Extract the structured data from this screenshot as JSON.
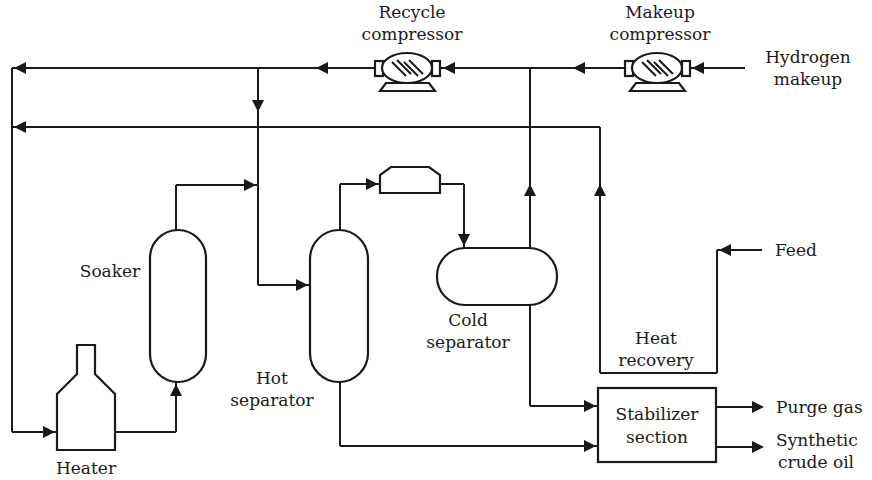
{
  "diagram": {
    "type": "process-flow",
    "colors": {
      "line": "#1a1a1a",
      "background": "#ffffff"
    },
    "equipment": [
      {
        "id": "recycle-compressor",
        "label_lines": [
          "Recycle",
          "compressor"
        ]
      },
      {
        "id": "makeup-compressor",
        "label_lines": [
          "Makeup",
          "compressor"
        ]
      },
      {
        "id": "soaker",
        "label_lines": [
          "Soaker"
        ]
      },
      {
        "id": "heater",
        "label_lines": [
          "Heater"
        ]
      },
      {
        "id": "hot-separator",
        "label_lines": [
          "Hot",
          "separator"
        ]
      },
      {
        "id": "cold-separator",
        "label_lines": [
          "Cold",
          "separator"
        ]
      },
      {
        "id": "cooler",
        "label_lines": []
      },
      {
        "id": "heat-recovery",
        "label_lines": [
          "Heat",
          "recovery"
        ]
      },
      {
        "id": "stabilizer-section",
        "label_lines": [
          "Stabilizer",
          "section"
        ]
      }
    ],
    "streams": [
      {
        "id": "hydrogen-makeup",
        "label_lines": [
          "Hydrogen",
          "makeup"
        ]
      },
      {
        "id": "feed",
        "label_lines": [
          "Feed"
        ]
      },
      {
        "id": "purge-gas",
        "label_lines": [
          "Purge gas"
        ]
      },
      {
        "id": "synthetic-crude-oil",
        "label_lines": [
          "Synthetic",
          "crude oil"
        ]
      }
    ]
  }
}
